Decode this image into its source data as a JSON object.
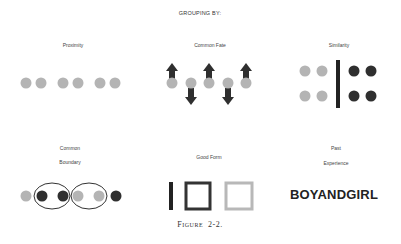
{
  "title": "GROUPING BY:",
  "panels": [
    {
      "label": "Proximity"
    },
    {
      "label": "Common Fate"
    },
    {
      "label": "Similarity"
    },
    {
      "label_line1": "Common",
      "label_line2": "Boundary"
    },
    {
      "label": "Good Form"
    },
    {
      "label_line1": "Past",
      "label_line2": "Experience",
      "word": "BOYANDGIRL"
    }
  ],
  "caption": {
    "prefix": "F",
    "smallcaps": "IGURE",
    "number": "2-2."
  },
  "colors": {
    "light": "#b4b4b4",
    "dark": "#2f2f2f"
  }
}
